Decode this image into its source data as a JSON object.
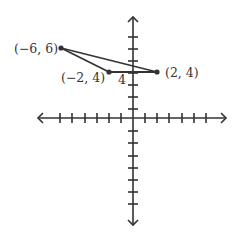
{
  "diagram": {
    "type": "coordinate-plane",
    "colors": {
      "stroke": "#333333",
      "background": "#ffffff"
    },
    "axes": {
      "x_range": [
        -8,
        8
      ],
      "y_range": [
        -8,
        8
      ],
      "tick_spacing": 1
    },
    "points": [
      {
        "label": "(−6, 6)",
        "x": -6,
        "y": 6
      },
      {
        "label": "(−2, 4)",
        "x": -2,
        "y": 4
      },
      {
        "label": "(2, 4)",
        "x": 2,
        "y": 4
      }
    ],
    "segments": [
      {
        "from": "(-6, 6)",
        "to": "(-2, 4)"
      },
      {
        "from": "(-2, 4)",
        "to": "(2, 4)"
      },
      {
        "from": "(-6, 6)",
        "to": "(2, 4)"
      }
    ],
    "length_label": "4"
  }
}
